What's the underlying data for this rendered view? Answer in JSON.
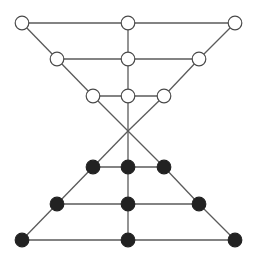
{
  "diagram": {
    "title": "",
    "type": "graph",
    "node_styles": {
      "white": {
        "fill": "#ffffff",
        "stroke": "#4a4a4a"
      },
      "black": {
        "fill": "#222222",
        "stroke": "#222222"
      }
    },
    "edge_color": "#5a5a5a",
    "nodes": [
      {
        "id": "w1",
        "style": "white",
        "row": 0,
        "col": 0
      },
      {
        "id": "w2",
        "style": "white",
        "row": 0,
        "col": 1
      },
      {
        "id": "w3",
        "style": "white",
        "row": 0,
        "col": 2
      },
      {
        "id": "w4",
        "style": "white",
        "row": 1,
        "col": 0
      },
      {
        "id": "w5",
        "style": "white",
        "row": 1,
        "col": 1
      },
      {
        "id": "w6",
        "style": "white",
        "row": 1,
        "col": 2
      },
      {
        "id": "w7",
        "style": "white",
        "row": 2,
        "col": 0
      },
      {
        "id": "w8",
        "style": "white",
        "row": 2,
        "col": 1
      },
      {
        "id": "w9",
        "style": "white",
        "row": 2,
        "col": 2
      },
      {
        "id": "b1",
        "style": "black",
        "row": 4,
        "col": 0
      },
      {
        "id": "b2",
        "style": "black",
        "row": 4,
        "col": 1
      },
      {
        "id": "b3",
        "style": "black",
        "row": 4,
        "col": 2
      },
      {
        "id": "b4",
        "style": "black",
        "row": 5,
        "col": 0
      },
      {
        "id": "b5",
        "style": "black",
        "row": 5,
        "col": 1
      },
      {
        "id": "b6",
        "style": "black",
        "row": 5,
        "col": 2
      },
      {
        "id": "b7",
        "style": "black",
        "row": 6,
        "col": 0
      },
      {
        "id": "b8",
        "style": "black",
        "row": 6,
        "col": 1
      },
      {
        "id": "b9",
        "style": "black",
        "row": 6,
        "col": 2
      }
    ],
    "crossing": {
      "id": "x",
      "row": 3,
      "col": 1
    },
    "edges": [
      [
        "w1",
        "w2"
      ],
      [
        "w2",
        "w3"
      ],
      [
        "w4",
        "w5"
      ],
      [
        "w5",
        "w6"
      ],
      [
        "w7",
        "w8"
      ],
      [
        "w8",
        "w9"
      ],
      [
        "w1",
        "w4"
      ],
      [
        "w4",
        "w7"
      ],
      [
        "w7",
        "x"
      ],
      [
        "w3",
        "w6"
      ],
      [
        "w6",
        "w9"
      ],
      [
        "w9",
        "x"
      ],
      [
        "w2",
        "w5"
      ],
      [
        "w5",
        "w8"
      ],
      [
        "w8",
        "x"
      ],
      [
        "x",
        "b1"
      ],
      [
        "x",
        "b2"
      ],
      [
        "x",
        "b3"
      ],
      [
        "b1",
        "b2"
      ],
      [
        "b2",
        "b3"
      ],
      [
        "b4",
        "b5"
      ],
      [
        "b5",
        "b6"
      ],
      [
        "b7",
        "b8"
      ],
      [
        "b8",
        "b9"
      ],
      [
        "b1",
        "b4"
      ],
      [
        "b4",
        "b7"
      ],
      [
        "b3",
        "b6"
      ],
      [
        "b6",
        "b9"
      ],
      [
        "b2",
        "b5"
      ],
      [
        "b5",
        "b8"
      ]
    ]
  }
}
